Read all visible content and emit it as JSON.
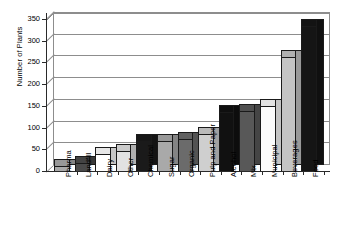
{
  "chart_data": {
    "type": "bar",
    "title": "",
    "xlabel": "",
    "ylabel": "Number of Plants",
    "ylim": [
      0,
      350
    ],
    "ytick_labels": [
      "0",
      "50",
      "100",
      "150",
      "200",
      "250",
      "300",
      "350"
    ],
    "ytick_values": [
      0,
      50,
      100,
      150,
      200,
      250,
      300,
      350
    ],
    "grid": true,
    "legend": "none",
    "style": "3d-bar",
    "categories": [
      "Pharma",
      "Landfill",
      "Dairy",
      "Other",
      "Chemical",
      "Sugar",
      "Organic",
      "Pulp and Paper",
      "Alcohol",
      "Mix",
      "Municipal",
      "Beverages",
      "Food"
    ],
    "values": [
      12,
      18,
      38,
      45,
      68,
      70,
      74,
      85,
      136,
      138,
      150,
      262,
      335
    ],
    "bar_colors": [
      "#a9a9a9",
      "#4a4a4a",
      "#ffffff",
      "#e2e2e2",
      "#1a1a1a",
      "#a9a9a9",
      "#6b6b6b",
      "#cfcfcf",
      "#111111",
      "#585858",
      "#fbfbfb",
      "#c4c4c4",
      "#151515"
    ]
  },
  "axis": {
    "y_title": "Number of Plants"
  }
}
